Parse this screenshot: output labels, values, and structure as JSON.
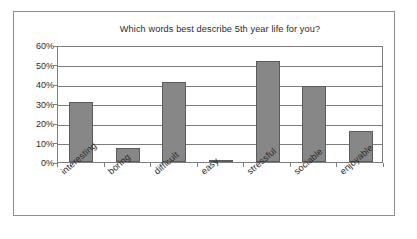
{
  "chart_data": {
    "type": "bar",
    "title": "Which words best describe 5th year life for you?",
    "xlabel": "",
    "ylabel": "",
    "categories": [
      "interesting",
      "boring",
      "difficult",
      "easy",
      "stressful",
      "sociable",
      "enjoyable"
    ],
    "values": [
      31,
      7,
      41,
      1,
      52,
      39,
      16
    ],
    "value_labels": [
      "31%",
      "7%",
      "41%",
      "1%",
      "52%",
      "39%",
      "16%"
    ],
    "ytick_labels": [
      "0%",
      "10%",
      "20%",
      "30%",
      "40%",
      "50%",
      "60%"
    ],
    "yticks": [
      0,
      10,
      20,
      30,
      40,
      50,
      60
    ],
    "ylim": [
      0,
      60
    ],
    "grid": true,
    "legend": false,
    "legend_position": "none",
    "series": [
      {
        "name": "Percentage of respondents",
        "values": [
          31,
          7,
          41,
          1,
          52,
          39,
          16
        ]
      }
    ],
    "colors": {
      "bar_fill": "#878787",
      "bar_edge": "#5c5c5c",
      "axis": "#7d7d7d",
      "frame": "#8e8e8e",
      "text": "#2b2b2b",
      "background": "#ffffff"
    }
  }
}
